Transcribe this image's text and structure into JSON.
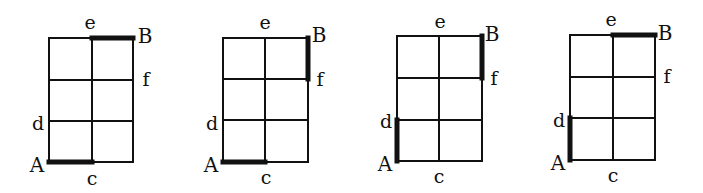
{
  "diagram": {
    "type": "grid-path-figures",
    "colors": {
      "line": "#111111",
      "background": "#ffffff"
    },
    "grids": [
      {
        "id": 1,
        "x": [
          49,
          92,
          133
        ],
        "y": [
          38,
          80,
          121,
          162
        ],
        "highlighted_edges": [
          {
            "from": "A",
            "to": "c",
            "x1": 49,
            "y1": 162,
            "x2": 92,
            "y2": 162
          },
          {
            "from": "e",
            "to": "B",
            "x1": 92,
            "y1": 38,
            "x2": 133,
            "y2": 38
          }
        ],
        "labels": {
          "A": {
            "text": "A",
            "x": 37,
            "y": 172
          },
          "B": {
            "text": "B",
            "x": 145,
            "y": 43
          },
          "c": {
            "text": "c",
            "x": 92,
            "y": 185
          },
          "d": {
            "text": "d",
            "x": 38,
            "y": 130
          },
          "e": {
            "text": "e",
            "x": 90,
            "y": 29
          },
          "f": {
            "text": "f",
            "x": 146,
            "y": 86
          }
        }
      },
      {
        "id": 2,
        "x": [
          223,
          265,
          308
        ],
        "y": [
          38,
          79,
          120,
          162
        ],
        "highlighted_edges": [
          {
            "from": "A",
            "to": "c",
            "x1": 223,
            "y1": 162,
            "x2": 265,
            "y2": 162
          },
          {
            "from": "B",
            "to": "f",
            "x1": 308,
            "y1": 38,
            "x2": 308,
            "y2": 79
          }
        ],
        "labels": {
          "A": {
            "text": "A",
            "x": 211,
            "y": 172
          },
          "B": {
            "text": "B",
            "x": 319,
            "y": 42
          },
          "c": {
            "text": "c",
            "x": 266,
            "y": 184
          },
          "d": {
            "text": "d",
            "x": 212,
            "y": 130
          },
          "e": {
            "text": "e",
            "x": 265,
            "y": 29
          },
          "f": {
            "text": "f",
            "x": 320,
            "y": 86
          }
        }
      },
      {
        "id": 3,
        "x": [
          397,
          439,
          482
        ],
        "y": [
          36,
          78,
          120,
          161
        ],
        "highlighted_edges": [
          {
            "from": "A",
            "to": "d",
            "x1": 397,
            "y1": 161,
            "x2": 397,
            "y2": 120
          },
          {
            "from": "B",
            "to": "f",
            "x1": 482,
            "y1": 36,
            "x2": 482,
            "y2": 78
          }
        ],
        "labels": {
          "A": {
            "text": "A",
            "x": 385,
            "y": 171
          },
          "B": {
            "text": "B",
            "x": 492,
            "y": 41
          },
          "c": {
            "text": "c",
            "x": 439,
            "y": 183
          },
          "d": {
            "text": "d",
            "x": 386,
            "y": 128
          },
          "e": {
            "text": "e",
            "x": 440,
            "y": 28
          },
          "f": {
            "text": "f",
            "x": 494,
            "y": 85
          }
        }
      },
      {
        "id": 4,
        "x": [
          570,
          613,
          655
        ],
        "y": [
          35,
          77,
          118,
          160
        ],
        "highlighted_edges": [
          {
            "from": "A",
            "to": "d",
            "x1": 570,
            "y1": 160,
            "x2": 570,
            "y2": 118
          },
          {
            "from": "e",
            "to": "B",
            "x1": 613,
            "y1": 35,
            "x2": 655,
            "y2": 35
          }
        ],
        "labels": {
          "A": {
            "text": "A",
            "x": 558,
            "y": 170
          },
          "B": {
            "text": "B",
            "x": 665,
            "y": 40
          },
          "c": {
            "text": "c",
            "x": 613,
            "y": 182
          },
          "d": {
            "text": "d",
            "x": 559,
            "y": 127
          },
          "e": {
            "text": "e",
            "x": 611,
            "y": 26
          },
          "f": {
            "text": "f",
            "x": 667,
            "y": 83
          }
        }
      }
    ]
  }
}
